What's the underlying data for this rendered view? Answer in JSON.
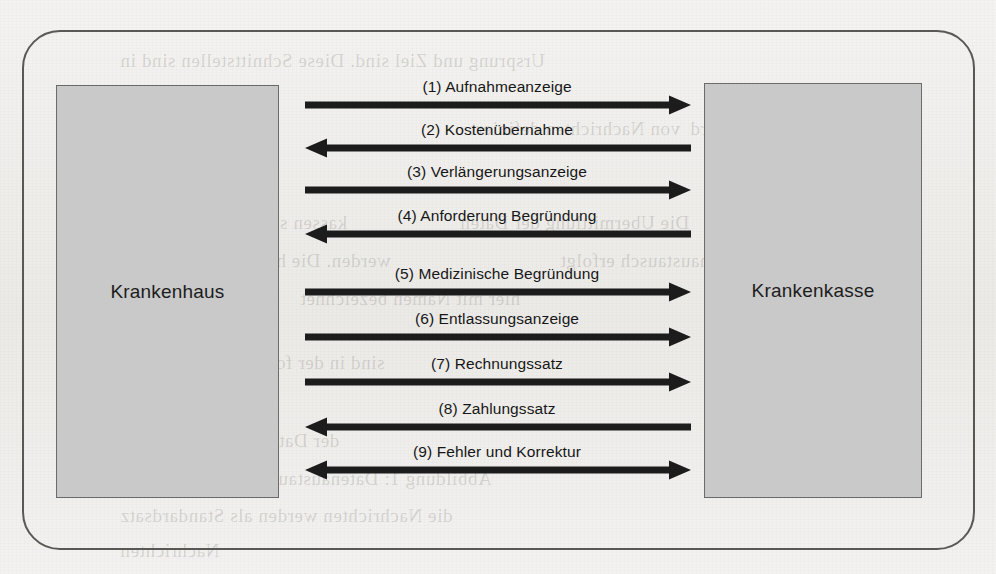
{
  "diagram": {
    "type": "sequence-communication",
    "parties": [
      {
        "id": "hospital",
        "label": "Krankenhaus",
        "side": "left"
      },
      {
        "id": "insurer",
        "label": "Krankenkasse",
        "side": "right"
      }
    ],
    "colors": {
      "box_fill": "#c9c9c9",
      "box_border": "#6b6b6b",
      "frame_border": "#5a5854",
      "arrow": "#1c1c1c",
      "text": "#171717",
      "background": "#f2f1ef"
    },
    "messages": [
      {
        "number": "(1)",
        "label": "(1) Aufnahmeanzeige",
        "direction": "right",
        "y": 105
      },
      {
        "number": "(2)",
        "label": "(2) Kostenübernahme",
        "direction": "left",
        "y": 148
      },
      {
        "number": "(3)",
        "label": "(3) Verlängerungsanzeige",
        "direction": "right",
        "y": 190
      },
      {
        "number": "(4)",
        "label": "(4) Anforderung Begründung",
        "direction": "left",
        "y": 234
      },
      {
        "number": "(5)",
        "label": "(5) Medizinische Begründung",
        "direction": "right",
        "y": 292
      },
      {
        "number": "(6)",
        "label": "(6) Entlassungsanzeige",
        "direction": "right",
        "y": 337
      },
      {
        "number": "(7)",
        "label": "(7) Rechnungssatz",
        "direction": "right",
        "y": 382
      },
      {
        "number": "(8)",
        "label": "(8) Zahlungssatz",
        "direction": "left",
        "y": 427
      },
      {
        "number": "(9)",
        "label": "(9) Fehler und Korrektur",
        "direction": "both",
        "y": 470
      }
    ],
    "geometry": {
      "arrow_x_start": 305,
      "arrow_x_end": 691,
      "label_center_x": 497
    },
    "background_bleed": [
      {
        "text": "Ursprung und Ziel sind. Diese Schnittstellen sind in",
        "x": 120,
        "y": 50
      },
      {
        "text": "von Nachrichten definiert",
        "x": 470,
        "y": 118
      },
      {
        "text": "werden kann. Es wird",
        "x": 690,
        "y": 118
      },
      {
        "text": "2.1",
        "x": 120,
        "y": 155
      },
      {
        "text": "kassen sind nach §301 SGB",
        "x": 120,
        "y": 212
      },
      {
        "text": "Die Ubermittlung der Daten",
        "x": 460,
        "y": 212
      },
      {
        "text": "werden. Die hierbei verwendeten",
        "x": 120,
        "y": 250
      },
      {
        "text": "Datenaustausch erfolgt",
        "x": 560,
        "y": 250
      },
      {
        "text": "hier mit Namen bezeichnet",
        "x": 300,
        "y": 288
      },
      {
        "text": "sind in der folgenden Abbildung",
        "x": 120,
        "y": 352
      },
      {
        "text": "der Datenaustausch erfolgt",
        "x": 120,
        "y": 430
      },
      {
        "text": "Abbildung 1: Datenaustausch zwischen",
        "x": 170,
        "y": 468
      },
      {
        "text": "die Nachrichten werden als Standardsatz",
        "x": 120,
        "y": 505
      },
      {
        "text": "Nachrichten",
        "x": 120,
        "y": 540
      }
    ]
  }
}
